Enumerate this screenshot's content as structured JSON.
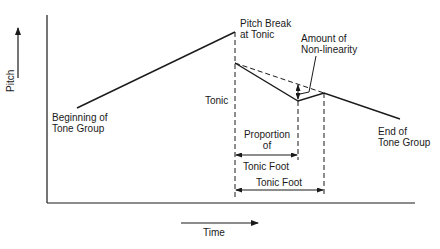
{
  "diagram": {
    "type": "pitch contour schematic",
    "axes": {
      "y_label": "Pitch",
      "x_label": "Time"
    },
    "labels": {
      "beginning": [
        "Beginning of",
        "Tone Group"
      ],
      "pitch_break": [
        "Pitch Break",
        "at Tonic"
      ],
      "nonlinearity": [
        "Amount of",
        "Non-linearity"
      ],
      "tonic": "Tonic",
      "end": [
        "End of",
        "Tone Group"
      ],
      "proportion": [
        "Proportion",
        "of"
      ],
      "proportion_tonic_foot": "Tonic Foot",
      "tonic_foot": "Tonic Foot"
    },
    "colors": {
      "line": "#1a1a1a",
      "background": "#ffffff"
    }
  }
}
